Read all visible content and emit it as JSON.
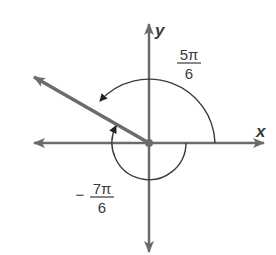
{
  "figure": {
    "type": "angle-diagram",
    "colors": {
      "axis": "#6b6b6b",
      "ray": "#6b6b6b",
      "arc": "#3a3a3a",
      "text": "#3a3a3a",
      "background": "#ffffff"
    },
    "axes": {
      "x_label": "x",
      "y_label": "y"
    },
    "terminal_ray": {
      "angle_degrees": 150
    },
    "angles": [
      {
        "name": "positive-angle",
        "sign": "",
        "numerator": "5π",
        "denominator": "6",
        "direction": "counterclockwise"
      },
      {
        "name": "negative-angle",
        "sign": "−",
        "numerator": "7π",
        "denominator": "6",
        "direction": "clockwise"
      }
    ]
  }
}
